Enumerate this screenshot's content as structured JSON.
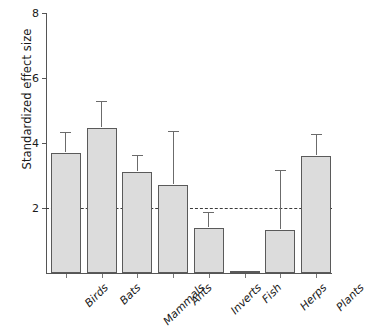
{
  "chart_data": {
    "type": "bar",
    "title": "",
    "xlabel": "",
    "ylabel": "Standardized effect size",
    "categories": [
      "Birds",
      "Bats",
      "Mammals",
      "Ants",
      "Inverts",
      "Fish",
      "Herps",
      "Plants"
    ],
    "values": [
      3.7,
      4.45,
      3.1,
      2.7,
      1.4,
      0.05,
      1.33,
      3.6
    ],
    "error_upper": [
      4.3,
      5.25,
      3.6,
      4.35,
      1.85,
      0.07,
      3.15,
      4.25
    ],
    "ylim": [
      0,
      8
    ],
    "yticks": [
      2,
      4,
      6,
      8
    ],
    "ytick_labels": [
      "2",
      "4",
      "6",
      "8"
    ],
    "grid": false,
    "legend": "none",
    "reference_line": {
      "value": 2,
      "style": "dashed",
      "color": "#3a3a3a"
    },
    "bar_fill_color": "#dcdcdc",
    "bar_edge_color": "#5a5a5a",
    "error_bar_color": "#6b6b6b",
    "axis_color": "#555555",
    "error_bar_type": "upper-only"
  }
}
